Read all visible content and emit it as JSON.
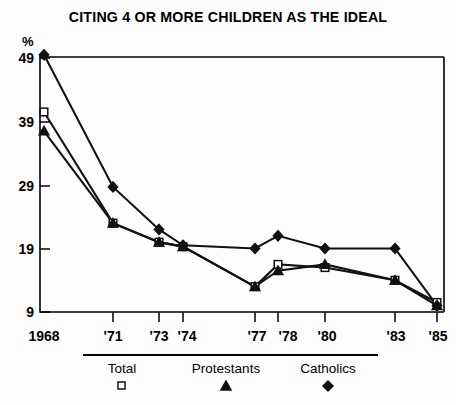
{
  "chart_data": {
    "type": "line",
    "title": "CITING 4 OR MORE CHILDREN AS THE IDEAL",
    "xlabel": "",
    "ylabel": "%",
    "categories": [
      "1968",
      "'71",
      "'73",
      "'74",
      "'77",
      "'78",
      "'80",
      "'83",
      "'85"
    ],
    "x": [
      1968,
      1971,
      1973,
      1974,
      1977,
      1978,
      1980,
      1983,
      1985
    ],
    "ylim": [
      9,
      49
    ],
    "yticks": [
      9,
      19,
      29,
      39,
      49
    ],
    "ytick_labels": [
      "9",
      "19",
      "29",
      "39",
      "49"
    ],
    "grid": false,
    "legend_position": "bottom",
    "series": [
      {
        "name": "Total",
        "marker": "open-square",
        "values": [
          40.5,
          23.0,
          20.0,
          19.3,
          13.0,
          16.5,
          16.0,
          14.0,
          10.5
        ]
      },
      {
        "name": "Protestants",
        "marker": "filled-triangle",
        "values": [
          37.5,
          23.0,
          20.0,
          19.3,
          13.0,
          15.5,
          16.5,
          14.0,
          10.0
        ]
      },
      {
        "name": "Catholics",
        "marker": "filled-diamond",
        "values": [
          49.5,
          28.7,
          22.0,
          19.5,
          19.0,
          21.0,
          19.0,
          19.0,
          10.0
        ]
      }
    ]
  },
  "legend": {
    "items": [
      {
        "label": "Total",
        "marker": "open-square"
      },
      {
        "label": "Protestants",
        "marker": "filled-triangle"
      },
      {
        "label": "Catholics",
        "marker": "filled-diamond"
      }
    ]
  },
  "colors": {
    "ink": "#111111",
    "background": "#fdfdfd"
  }
}
